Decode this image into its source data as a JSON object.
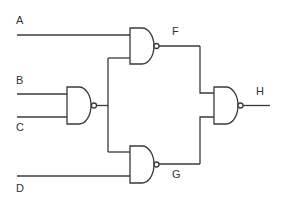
{
  "diagram": {
    "type": "logic-circuit",
    "gate_type": "NAND",
    "inputs": [
      "A",
      "B",
      "C",
      "D"
    ],
    "intermediate": [
      "F",
      "G"
    ],
    "output": "H",
    "labels": {
      "A": "A",
      "B": "B",
      "C": "C",
      "D": "D",
      "F": "F",
      "G": "G",
      "H": "H"
    },
    "connections": [
      {
        "gate": "NAND1",
        "inputs": [
          "B",
          "C"
        ],
        "output": "BC_out"
      },
      {
        "gate": "NAND_F",
        "inputs": [
          "A",
          "BC_out"
        ],
        "output": "F"
      },
      {
        "gate": "NAND_G",
        "inputs": [
          "BC_out",
          "D"
        ],
        "output": "G"
      },
      {
        "gate": "NAND_H",
        "inputs": [
          "F",
          "G"
        ],
        "output": "H"
      }
    ],
    "colors": {
      "line": "#3a3a3a",
      "background": "#ffffff"
    }
  }
}
